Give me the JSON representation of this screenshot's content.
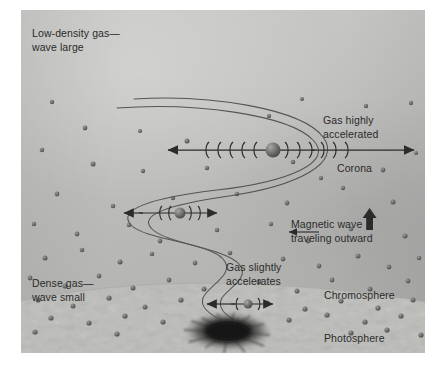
{
  "figure": {
    "type": "solar-atmosphere-magnetic-wave-diagram",
    "labels": {
      "low_density": "Low-density gas—\nwave large",
      "gas_highly_accelerated": "Gas highly\naccelerated",
      "corona": "Corona",
      "magnetic_wave": "Magnetic wave\ntraveling outward",
      "gas_slightly_accelerates": "Gas slightly\naccelerates",
      "dense_gas": "Dense gas—\nwave small",
      "chromosphere": "Chromosphere",
      "photosphere": "Photosphere"
    },
    "colors": {
      "background_top": "#c8c8c6",
      "background_bottom": "#adadab",
      "photosphere": "#cfcfcc",
      "ink": "#2b2b2b",
      "fieldline": "#5a5a58",
      "particle": "#6e6e6c",
      "sunspot": "#141414"
    },
    "oscillations": [
      {
        "name": "corona-oscillation",
        "amplitude": "large",
        "arcs_left": 5,
        "arcs_right": 6,
        "sphere_radius": 7.5
      },
      {
        "name": "chromosphere-upper-oscillation",
        "amplitude": "medium",
        "arcs_left": 2,
        "arcs_right": 2,
        "sphere_radius": 5.5
      },
      {
        "name": "chromosphere-lower-oscillation",
        "amplitude": "small",
        "arcs_left": 1,
        "arcs_right": 1,
        "sphere_radius": 4.5
      }
    ],
    "wave_count": 2,
    "layers": [
      "Photosphere",
      "Chromosphere",
      "Corona"
    ]
  }
}
